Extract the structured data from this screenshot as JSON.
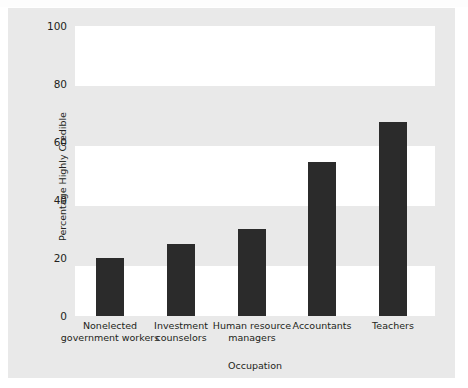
{
  "chart_data": {
    "type": "bar",
    "title": "",
    "xlabel": "Occupation",
    "ylabel": "Percentage Highly Credible",
    "categories": [
      "Nonelected government workers",
      "Investment counselors",
      "Human resource managers",
      "Accountants",
      "Teachers"
    ],
    "category_lines": [
      [
        "Nonelected",
        "government workers"
      ],
      [
        "Investment",
        "counselors"
      ],
      [
        "Human resource",
        "managers"
      ],
      [
        "Accountants"
      ],
      [
        "Teachers"
      ]
    ],
    "values": [
      20,
      25,
      30,
      53,
      67
    ],
    "ylim": [
      0,
      100
    ],
    "yticks": [
      0,
      20,
      40,
      60,
      80,
      100
    ],
    "ytick_labels": [
      "0",
      "20",
      "40",
      "60",
      "80",
      "100"
    ],
    "grid": false,
    "banded_background": true,
    "legend": null,
    "colors": {
      "bar": "#2b2b2b",
      "figure_background": "#e9e9e9",
      "band": "#ffffff",
      "text": "#231f20"
    }
  }
}
